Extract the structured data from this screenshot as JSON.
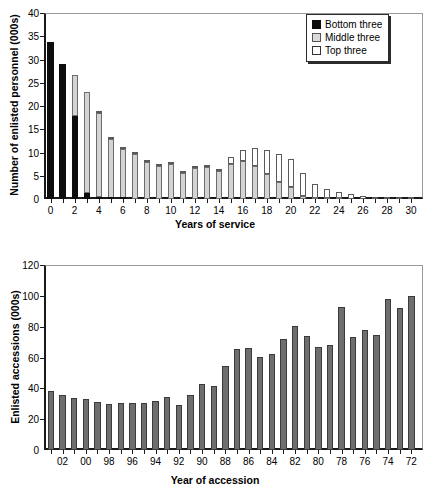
{
  "chart_data": [
    {
      "type": "bar",
      "id": "enlisted-personnel-by-years-of-service",
      "title": "",
      "xlabel": "Years of service",
      "ylabel": "Number of enlisted personnel (000s)",
      "ylim": [
        0,
        40
      ],
      "yticks": [
        0,
        5,
        10,
        15,
        20,
        25,
        30,
        35,
        40
      ],
      "xlim": [
        -0.5,
        31
      ],
      "xticks": [
        0,
        1,
        2,
        3,
        4,
        5,
        6,
        7,
        8,
        9,
        10,
        11,
        12,
        13,
        14,
        15,
        16,
        17,
        18,
        19,
        20,
        21,
        22,
        23,
        24,
        25,
        26,
        27,
        28,
        29,
        30
      ],
      "xticklabels": [
        "0",
        "",
        "2",
        "",
        "4",
        "",
        "6",
        "",
        "8",
        "",
        "10",
        "",
        "12",
        "",
        "14",
        "",
        "16",
        "",
        "18",
        "",
        "20",
        "",
        "22",
        "",
        "24",
        "",
        "26",
        "",
        "28",
        "",
        "30"
      ],
      "grid": false,
      "stacked": true,
      "legend_position": "top-right",
      "categories": [
        "0",
        "1",
        "2",
        "3",
        "4",
        "5",
        "6",
        "7",
        "8",
        "9",
        "10",
        "11",
        "12",
        "13",
        "14",
        "15",
        "16",
        "17",
        "18",
        "19",
        "20",
        "21",
        "22",
        "23",
        "24",
        "25",
        "26",
        "27",
        "28",
        "29",
        "30"
      ],
      "series": [
        {
          "name": "Bottom three",
          "color": "#0d0d0d",
          "values": [
            33.7,
            29.0,
            17.8,
            1.4,
            0.4,
            0.1,
            0.1,
            0.0,
            0.0,
            0.0,
            0.0,
            0.0,
            0.0,
            0.0,
            0.0,
            0.0,
            0.0,
            0.0,
            0.0,
            0.0,
            0.0,
            0.0,
            0.0,
            0.0,
            0.0,
            0.0,
            0.0,
            0.0,
            0.0,
            0.0,
            0.0
          ]
        },
        {
          "name": "Middle three",
          "color": "#d4d4d4",
          "values": [
            0.0,
            0.0,
            8.9,
            21.6,
            18.0,
            12.9,
            10.7,
            9.6,
            7.9,
            7.2,
            7.5,
            5.7,
            6.7,
            6.9,
            6.1,
            7.6,
            8.2,
            7.0,
            5.3,
            3.7,
            2.5,
            0.6,
            0.3,
            0.1,
            0.1,
            0.0,
            0.0,
            0.0,
            0.0,
            0.0,
            0.0
          ]
        },
        {
          "name": "Top three",
          "color": "#ffffff",
          "values": [
            0.0,
            0.0,
            0.0,
            0.0,
            0.4,
            0.1,
            0.2,
            0.1,
            0.2,
            0.2,
            0.3,
            0.2,
            0.2,
            0.3,
            0.4,
            1.4,
            2.3,
            4.0,
            5.3,
            5.9,
            6.2,
            5.0,
            2.9,
            2.0,
            1.5,
            1.0,
            0.6,
            0.4,
            0.2,
            0.1,
            0.1
          ]
        }
      ],
      "totals": [
        33.7,
        29.0,
        26.7,
        23.0,
        18.4,
        13.0,
        10.8,
        9.7,
        8.1,
        7.4,
        7.8,
        5.9,
        6.9,
        7.2,
        6.5,
        9.0,
        10.5,
        11.0,
        10.6,
        9.6,
        8.7,
        5.6,
        3.2,
        2.1,
        1.6,
        1.0,
        0.6,
        0.4,
        0.2,
        0.1,
        0.1
      ]
    },
    {
      "type": "bar",
      "id": "enlisted-accessions-by-year",
      "title": "",
      "xlabel": "Year of accession",
      "ylabel": "Enlisted accessions (000s)",
      "ylim": [
        0,
        120
      ],
      "yticks": [
        0,
        20,
        40,
        60,
        80,
        100,
        120
      ],
      "grid": false,
      "stacked": false,
      "bar_color": "#6e6e6e",
      "categories": [
        "03",
        "02",
        "01",
        "00",
        "99",
        "98",
        "97",
        "96",
        "95",
        "94",
        "93",
        "92",
        "91",
        "90",
        "89",
        "88",
        "87",
        "86",
        "85",
        "84",
        "83",
        "82",
        "81",
        "80",
        "79",
        "78",
        "77",
        "76",
        "75",
        "74",
        "73",
        "72"
      ],
      "xticklabels": [
        "",
        "02",
        "",
        "00",
        "",
        "98",
        "",
        "96",
        "",
        "94",
        "",
        "92",
        "",
        "90",
        "",
        "88",
        "",
        "86",
        "",
        "84",
        "",
        "82",
        "",
        "80",
        "",
        "78",
        "",
        "76",
        "",
        "74",
        "",
        "72"
      ],
      "values": [
        38.0,
        35.8,
        34.0,
        33.0,
        31.3,
        30.0,
        30.7,
        30.5,
        30.2,
        31.5,
        34.5,
        29.5,
        35.5,
        43.0,
        41.3,
        54.8,
        65.2,
        66.0,
        60.5,
        62.5,
        72.2,
        80.4,
        73.8,
        66.8,
        67.8,
        93.0,
        73.2,
        77.6,
        74.4,
        98.0,
        91.8,
        100.0
      ]
    }
  ],
  "top_chart": {
    "ylabel": "Number of enlisted personnel (000s)",
    "xlabel": "Years of service",
    "legend": {
      "items": [
        {
          "label": "Bottom three",
          "swatch": "black"
        },
        {
          "label": "Middle three",
          "swatch": "mid"
        },
        {
          "label": "Top three",
          "swatch": "top"
        }
      ]
    }
  },
  "bottom_chart": {
    "ylabel": "Enlisted accessions (000s)",
    "xlabel": "Year of accession"
  }
}
